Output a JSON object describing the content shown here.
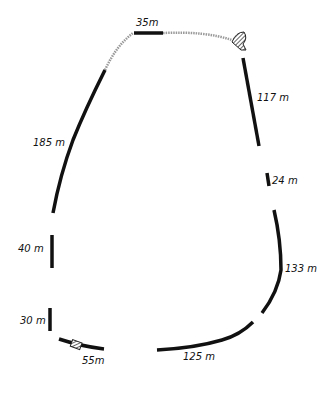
{
  "diagram": {
    "type": "track-outline",
    "segments": [
      {
        "id": "top",
        "label": "35m"
      },
      {
        "id": "right-upper",
        "label": "117 m"
      },
      {
        "id": "right-short",
        "label": "24 m"
      },
      {
        "id": "right-lower",
        "label": "133 m"
      },
      {
        "id": "bottom",
        "label": "125 m"
      },
      {
        "id": "bottom-left",
        "label": "55m"
      },
      {
        "id": "left-lower",
        "label": "30 m"
      },
      {
        "id": "left-mid",
        "label": "40 m"
      },
      {
        "id": "left-upper",
        "label": "185 m"
      }
    ],
    "colors": {
      "solid": "#111111",
      "dotted": "#9a9a9a",
      "background": "#ffffff"
    }
  }
}
